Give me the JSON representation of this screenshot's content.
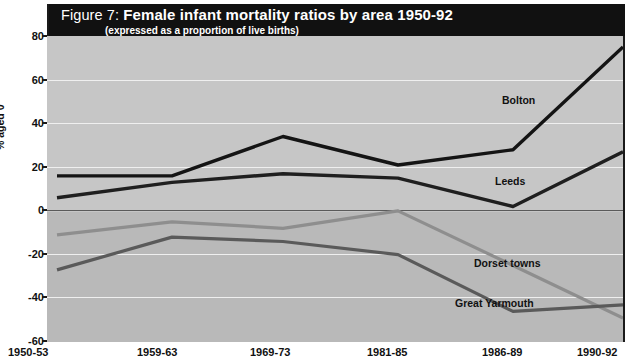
{
  "figure": {
    "number_label": "Figure 7:",
    "title": "Female infant mortality ratios by area 1950-92",
    "subtitle": "(expressed as a proportion of live births)"
  },
  "axes": {
    "ylabel": "% aged 0",
    "yticks": [
      "80",
      "60",
      "40",
      "20",
      "0",
      "-20",
      "-40",
      "-60"
    ],
    "xticks": [
      "1950-53",
      "1959-63",
      "1969-73",
      "1981-85",
      "1986-89",
      "1990-92"
    ]
  },
  "annotations": {
    "bolton": "Bolton",
    "leeds": "Leeds",
    "dorset": "Dorset towns",
    "yarmouth": "Great Yarmouth"
  },
  "colors": {
    "title_bar": "#111111",
    "plot_upper": "#c6c6c6",
    "plot_lower": "#b9b9b9",
    "axis": "#1a1a1a",
    "grid": "#efefef",
    "bolton": "#141414",
    "leeds": "#1f1f1f",
    "dorset": "#8e8e8e",
    "yarmouth": "#5a5a5a"
  },
  "chart_data": {
    "type": "line",
    "title": "Female infant mortality ratios by area 1950-92",
    "subtitle": "(expressed as a proportion of live births)",
    "xlabel": "",
    "ylabel": "% aged 0",
    "categories": [
      "1950-53",
      "1959-63",
      "1969-73",
      "1981-85",
      "1986-89",
      "1990-92"
    ],
    "ylim": [
      -60,
      80
    ],
    "ytick_step": 20,
    "grid": true,
    "legend": "inline-annotations",
    "series": [
      {
        "name": "Bolton",
        "values": [
          16,
          16,
          34,
          21,
          28,
          75
        ]
      },
      {
        "name": "Leeds",
        "values": [
          6,
          13,
          17,
          15,
          2,
          27
        ]
      },
      {
        "name": "Dorset towns",
        "values": [
          -11,
          -5,
          -8,
          0,
          -25,
          -49
        ]
      },
      {
        "name": "Great Yarmouth",
        "values": [
          -27,
          -12,
          -14,
          -20,
          -46,
          -43
        ]
      }
    ]
  }
}
